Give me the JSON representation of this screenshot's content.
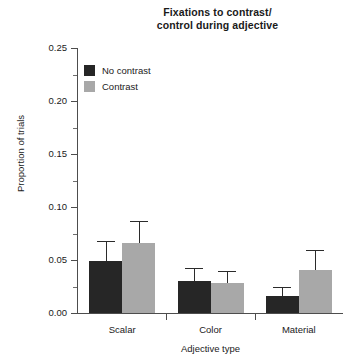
{
  "chart_data": {
    "type": "bar",
    "title": "Fixations to contrast/ control during adjective",
    "title_lines": [
      "Fixations to contrast/",
      "control during adjective"
    ],
    "xlabel": "Adjective type",
    "ylabel": "Proportion of trials",
    "categories": [
      "Scalar",
      "Color",
      "Material"
    ],
    "ylim": [
      0,
      0.25
    ],
    "ytick_labels": [
      "0.00",
      "0.05",
      "0.10",
      "0.15",
      "0.20",
      "0.25"
    ],
    "ytick_values": [
      0,
      0.05,
      0.1,
      0.15,
      0.2,
      0.25
    ],
    "yminor_values": [
      0.025,
      0.075,
      0.125,
      0.175,
      0.225
    ],
    "grid": false,
    "legend_position": "upper-left-inside",
    "series": [
      {
        "name": "No contrast",
        "color": "#262626",
        "values": [
          0.049,
          0.03,
          0.016
        ],
        "errors": [
          0.019,
          0.012,
          0.009
        ]
      },
      {
        "name": "Contrast",
        "color": "#a8a8a8",
        "values": [
          0.066,
          0.028,
          0.041
        ],
        "errors": [
          0.021,
          0.012,
          0.018
        ]
      }
    ]
  },
  "legend": {
    "entries": [
      {
        "label": "No contrast"
      },
      {
        "label": "Contrast"
      }
    ]
  },
  "colors": {
    "no_contrast": "#262626",
    "contrast": "#a8a8a8",
    "axis": "#4d4d4d",
    "text": "#1a1a1a",
    "background": "#ffffff"
  }
}
